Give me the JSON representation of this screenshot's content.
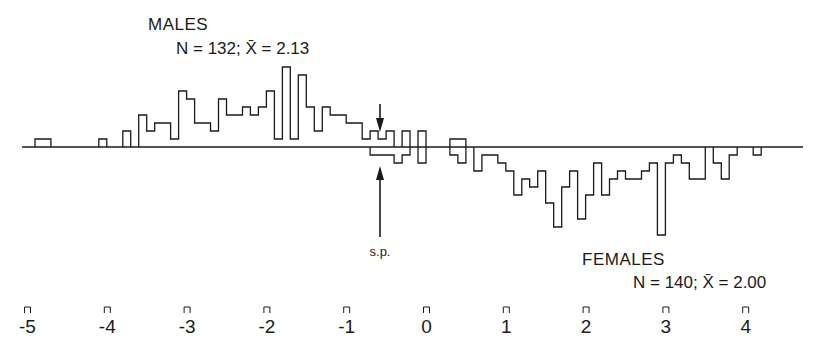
{
  "chart_data": {
    "type": "bar",
    "subtype": "back-to-back histogram",
    "title": "",
    "xlabel": "",
    "ylabel": "",
    "xlim": [
      -5.3,
      4.8
    ],
    "x_ticks": [
      -5,
      -4,
      -3,
      -2,
      -1,
      0,
      1,
      2,
      3,
      4
    ],
    "x_tick_labels": [
      "-5",
      "-4",
      "-3",
      "-2",
      "-1",
      "0",
      "1",
      "2",
      "3",
      "4"
    ],
    "bin_width": 0.1,
    "grid": false,
    "legend": null,
    "series": [
      {
        "name": "MALES",
        "label": "MALES",
        "stats": "N = 132; X̄ = 2.13",
        "N": 132,
        "mean": 2.13,
        "direction": "up",
        "bins": [
          {
            "x": -4.9,
            "count": 1
          },
          {
            "x": -4.8,
            "count": 1
          },
          {
            "x": -4.1,
            "count": 1
          },
          {
            "x": -3.8,
            "count": 2
          },
          {
            "x": -3.6,
            "count": 4
          },
          {
            "x": -3.5,
            "count": 2
          },
          {
            "x": -3.4,
            "count": 3
          },
          {
            "x": -3.3,
            "count": 3
          },
          {
            "x": -3.2,
            "count": 1
          },
          {
            "x": -3.1,
            "count": 7
          },
          {
            "x": -3.0,
            "count": 6
          },
          {
            "x": -2.9,
            "count": 3
          },
          {
            "x": -2.8,
            "count": 3
          },
          {
            "x": -2.7,
            "count": 2
          },
          {
            "x": -2.6,
            "count": 6
          },
          {
            "x": -2.5,
            "count": 4
          },
          {
            "x": -2.4,
            "count": 4
          },
          {
            "x": -2.3,
            "count": 5
          },
          {
            "x": -2.2,
            "count": 4
          },
          {
            "x": -2.1,
            "count": 5
          },
          {
            "x": -2.0,
            "count": 7
          },
          {
            "x": -1.9,
            "count": 1
          },
          {
            "x": -1.8,
            "count": 10
          },
          {
            "x": -1.7,
            "count": 1
          },
          {
            "x": -1.6,
            "count": 9
          },
          {
            "x": -1.5,
            "count": 5
          },
          {
            "x": -1.4,
            "count": 2
          },
          {
            "x": -1.3,
            "count": 5
          },
          {
            "x": -1.2,
            "count": 4
          },
          {
            "x": -1.1,
            "count": 4
          },
          {
            "x": -1.0,
            "count": 3
          },
          {
            "x": -0.9,
            "count": 3
          },
          {
            "x": -0.8,
            "count": 1
          },
          {
            "x": -0.7,
            "count": 2
          },
          {
            "x": -0.6,
            "count": 1
          },
          {
            "x": -0.5,
            "count": 2
          },
          {
            "x": -0.3,
            "count": 2
          },
          {
            "x": -0.1,
            "count": 2
          },
          {
            "x": 0.3,
            "count": 1
          },
          {
            "x": 0.4,
            "count": 1
          }
        ]
      },
      {
        "name": "FEMALES",
        "label": "FEMALES",
        "stats": "N = 140; X̄ = 2.00",
        "N": 140,
        "mean": 2.0,
        "direction": "down",
        "bins": [
          {
            "x": -0.7,
            "count": 1
          },
          {
            "x": -0.6,
            "count": 1
          },
          {
            "x": -0.5,
            "count": 1
          },
          {
            "x": -0.4,
            "count": 2
          },
          {
            "x": -0.3,
            "count": 1
          },
          {
            "x": -0.1,
            "count": 2
          },
          {
            "x": 0.3,
            "count": 1
          },
          {
            "x": 0.4,
            "count": 2
          },
          {
            "x": 0.6,
            "count": 3
          },
          {
            "x": 0.7,
            "count": 1
          },
          {
            "x": 0.8,
            "count": 1
          },
          {
            "x": 0.9,
            "count": 2
          },
          {
            "x": 1.0,
            "count": 3
          },
          {
            "x": 1.1,
            "count": 6
          },
          {
            "x": 1.2,
            "count": 4
          },
          {
            "x": 1.3,
            "count": 5
          },
          {
            "x": 1.4,
            "count": 3
          },
          {
            "x": 1.5,
            "count": 7
          },
          {
            "x": 1.6,
            "count": 10
          },
          {
            "x": 1.7,
            "count": 5
          },
          {
            "x": 1.8,
            "count": 3
          },
          {
            "x": 1.9,
            "count": 9
          },
          {
            "x": 2.0,
            "count": 6
          },
          {
            "x": 2.1,
            "count": 2
          },
          {
            "x": 2.2,
            "count": 6
          },
          {
            "x": 2.3,
            "count": 4
          },
          {
            "x": 2.4,
            "count": 3
          },
          {
            "x": 2.5,
            "count": 4
          },
          {
            "x": 2.6,
            "count": 4
          },
          {
            "x": 2.7,
            "count": 3
          },
          {
            "x": 2.8,
            "count": 2
          },
          {
            "x": 2.9,
            "count": 11
          },
          {
            "x": 3.0,
            "count": 2
          },
          {
            "x": 3.1,
            "count": 1
          },
          {
            "x": 3.2,
            "count": 2
          },
          {
            "x": 3.3,
            "count": 4
          },
          {
            "x": 3.4,
            "count": 4
          },
          {
            "x": 3.6,
            "count": 2
          },
          {
            "x": 3.7,
            "count": 4
          },
          {
            "x": 3.8,
            "count": 1
          },
          {
            "x": 4.1,
            "count": 1
          }
        ]
      }
    ],
    "annotations": [
      {
        "text": "s.p.",
        "x": -0.55,
        "note": "arrows pointing to the baseline from above and below"
      }
    ]
  },
  "labels": {
    "males_title": "MALES",
    "males_stats": "N = 132; X̄ = 2.13",
    "females_title": "FEMALES",
    "females_stats": "N = 140; X̄ = 2.00",
    "sp_label": "s.p."
  },
  "style": {
    "ink": "#1a1a1a",
    "background": "#ffffff"
  }
}
